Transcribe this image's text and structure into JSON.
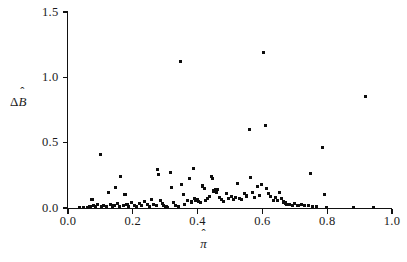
{
  "chart_data": {
    "type": "scatter",
    "title": "",
    "xlabel": "π̂",
    "ylabel": "Δ B̂",
    "xlabel_base": "π",
    "xlabel_hat": "ˆ",
    "ylabel_delta": "Δ",
    "ylabel_base": "B",
    "ylabel_hat": "ˆ",
    "xlim": [
      0.0,
      1.0
    ],
    "ylim": [
      0.0,
      1.5
    ],
    "grid": false,
    "legend": "none",
    "marker": "square",
    "marker_color": "#0d0d0d",
    "xticks": [
      0.0,
      0.2,
      0.4,
      0.6,
      0.8,
      1.0
    ],
    "xtick_labels": [
      "0.0",
      "0.2",
      "0.4",
      "0.6",
      "0.8",
      "1.0"
    ],
    "yticks": [
      0.0,
      0.5,
      1.0,
      1.5
    ],
    "ytick_labels": [
      "0.0",
      "0.5",
      "1.0",
      "1.5"
    ],
    "points": [
      [
        0.035,
        0.005
      ],
      [
        0.048,
        0.004
      ],
      [
        0.06,
        0.006
      ],
      [
        0.068,
        0.01
      ],
      [
        0.074,
        0.062
      ],
      [
        0.08,
        0.018
      ],
      [
        0.086,
        0.008
      ],
      [
        0.092,
        0.03
      ],
      [
        0.1,
        0.41
      ],
      [
        0.104,
        0.012
      ],
      [
        0.11,
        0.022
      ],
      [
        0.118,
        0.009
      ],
      [
        0.124,
        0.12
      ],
      [
        0.13,
        0.028
      ],
      [
        0.136,
        0.01
      ],
      [
        0.142,
        0.02
      ],
      [
        0.148,
        0.155
      ],
      [
        0.152,
        0.035
      ],
      [
        0.158,
        0.012
      ],
      [
        0.162,
        0.24
      ],
      [
        0.17,
        0.018
      ],
      [
        0.176,
        0.105
      ],
      [
        0.182,
        0.03
      ],
      [
        0.188,
        0.014
      ],
      [
        0.196,
        0.04
      ],
      [
        0.204,
        0.022
      ],
      [
        0.212,
        0.01
      ],
      [
        0.22,
        0.035
      ],
      [
        0.228,
        0.018
      ],
      [
        0.236,
        0.048
      ],
      [
        0.244,
        0.025
      ],
      [
        0.252,
        0.012
      ],
      [
        0.258,
        0.062
      ],
      [
        0.264,
        0.03
      ],
      [
        0.272,
        0.02
      ],
      [
        0.276,
        0.292
      ],
      [
        0.28,
        0.255
      ],
      [
        0.286,
        0.055
      ],
      [
        0.292,
        0.035
      ],
      [
        0.296,
        0.018
      ],
      [
        0.3,
        0.006
      ],
      [
        0.304,
        0.01
      ],
      [
        0.308,
        0.004
      ],
      [
        0.316,
        0.27
      ],
      [
        0.32,
        0.16
      ],
      [
        0.326,
        0.042
      ],
      [
        0.332,
        0.02
      ],
      [
        0.34,
        0.008
      ],
      [
        0.348,
        1.12
      ],
      [
        0.35,
        0.178
      ],
      [
        0.356,
        0.1
      ],
      [
        0.36,
        0.03
      ],
      [
        0.368,
        0.06
      ],
      [
        0.374,
        0.225
      ],
      [
        0.38,
        0.046
      ],
      [
        0.386,
        0.305
      ],
      [
        0.39,
        0.07
      ],
      [
        0.394,
        0.056
      ],
      [
        0.4,
        0.066
      ],
      [
        0.404,
        0.05
      ],
      [
        0.408,
        0.04
      ],
      [
        0.414,
        0.168
      ],
      [
        0.42,
        0.15
      ],
      [
        0.424,
        0.058
      ],
      [
        0.43,
        0.072
      ],
      [
        0.436,
        0.088
      ],
      [
        0.442,
        0.24
      ],
      [
        0.446,
        0.225
      ],
      [
        0.45,
        0.13
      ],
      [
        0.454,
        0.145
      ],
      [
        0.458,
        0.118
      ],
      [
        0.462,
        0.14
      ],
      [
        0.468,
        0.082
      ],
      [
        0.474,
        0.068
      ],
      [
        0.48,
        0.052
      ],
      [
        0.488,
        0.11
      ],
      [
        0.496,
        0.074
      ],
      [
        0.504,
        0.09
      ],
      [
        0.51,
        0.062
      ],
      [
        0.518,
        0.08
      ],
      [
        0.524,
        0.186
      ],
      [
        0.53,
        0.075
      ],
      [
        0.536,
        0.066
      ],
      [
        0.544,
        0.108
      ],
      [
        0.552,
        0.092
      ],
      [
        0.56,
        0.602
      ],
      [
        0.564,
        0.232
      ],
      [
        0.57,
        0.12
      ],
      [
        0.576,
        0.078
      ],
      [
        0.584,
        0.162
      ],
      [
        0.59,
        0.096
      ],
      [
        0.598,
        0.182
      ],
      [
        0.604,
        1.19
      ],
      [
        0.61,
        0.63
      ],
      [
        0.614,
        0.148
      ],
      [
        0.62,
        0.112
      ],
      [
        0.626,
        0.09
      ],
      [
        0.634,
        0.06
      ],
      [
        0.64,
        0.08
      ],
      [
        0.646,
        0.056
      ],
      [
        0.652,
        0.118
      ],
      [
        0.658,
        0.072
      ],
      [
        0.664,
        0.046
      ],
      [
        0.67,
        0.038
      ],
      [
        0.676,
        0.03
      ],
      [
        0.684,
        0.028
      ],
      [
        0.692,
        0.022
      ],
      [
        0.7,
        0.032
      ],
      [
        0.71,
        0.018
      ],
      [
        0.72,
        0.024
      ],
      [
        0.73,
        0.016
      ],
      [
        0.742,
        0.02
      ],
      [
        0.748,
        0.262
      ],
      [
        0.756,
        0.012
      ],
      [
        0.768,
        0.008
      ],
      [
        0.786,
        0.465
      ],
      [
        0.792,
        0.1
      ],
      [
        0.798,
        0.004
      ],
      [
        0.88,
        0.002
      ],
      [
        0.918,
        0.85
      ],
      [
        0.944,
        0.002
      ]
    ]
  }
}
